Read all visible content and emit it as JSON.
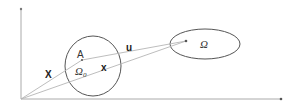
{
  "diagram": {
    "title": "",
    "axes": {
      "origin": [
        21,
        99
      ],
      "y_end": [
        21,
        8
      ],
      "x_end": [
        281,
        99
      ],
      "color": "#999999"
    },
    "regions": [
      {
        "id": "omega0",
        "label": "Ω",
        "subscript": "0",
        "shape": "ellipse",
        "cx": 93,
        "cy": 66,
        "rx": 28,
        "ry": 30,
        "stroke": "#555555"
      },
      {
        "id": "omega",
        "label": "Ω",
        "shape": "ellipse",
        "cx": 205,
        "cy": 44,
        "rx": 35,
        "ry": 15,
        "stroke": "#555555"
      }
    ],
    "points": [
      {
        "id": "A",
        "label": "A",
        "x": 82,
        "y": 60
      },
      {
        "id": "image-point",
        "label": "",
        "x": 186,
        "y": 41
      }
    ],
    "vectors": [
      {
        "id": "X",
        "label": "X",
        "from": [
          21,
          99
        ],
        "to": [
          82,
          60
        ]
      },
      {
        "id": "u",
        "label": "u",
        "from": [
          82,
          60
        ],
        "to": [
          186,
          41
        ]
      },
      {
        "id": "x",
        "label": "x",
        "from": [
          21,
          99
        ],
        "to": [
          186,
          41
        ]
      }
    ],
    "labels": {
      "X": "X",
      "x": "x",
      "u": "u",
      "A": "A",
      "omega0": "Ω",
      "omega0_sub": "0",
      "omega": "Ω"
    }
  }
}
